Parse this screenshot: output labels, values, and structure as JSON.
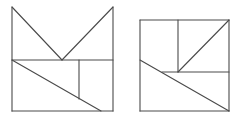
{
  "diagram": {
    "stroke_color": "#4a4a4a",
    "background": "#ffffff",
    "figures": [
      {
        "name": "left-figure",
        "shape": "square with V-shaped notch top (cat-ear silhouette)",
        "segments": [
          [
            12,
            7,
            12,
            111
          ],
          [
            12,
            7,
            62,
            60
          ],
          [
            62,
            60,
            113,
            7
          ],
          [
            113,
            7,
            113,
            111
          ],
          [
            12,
            111,
            113,
            111
          ],
          [
            12,
            60,
            113,
            60
          ],
          [
            12,
            60,
            101,
            111
          ],
          [
            79,
            60,
            79,
            99
          ]
        ]
      },
      {
        "name": "right-figure",
        "shape": "square dissected into triangles and rectangles",
        "segments": [
          [
            140,
            20,
            229,
            20
          ],
          [
            140,
            20,
            140,
            111
          ],
          [
            229,
            20,
            229,
            111
          ],
          [
            140,
            111,
            229,
            111
          ],
          [
            178,
            20,
            178,
            72
          ],
          [
            162,
            72,
            229,
            72
          ],
          [
            178,
            72,
            229,
            20
          ],
          [
            140,
            60,
            229,
            111
          ]
        ]
      }
    ]
  }
}
